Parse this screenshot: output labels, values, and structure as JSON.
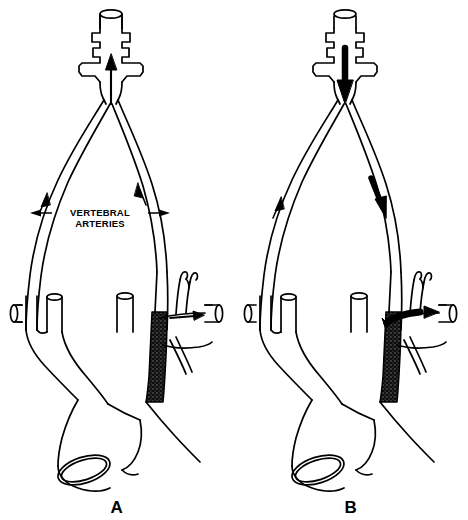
{
  "figure": {
    "type": "medical-illustration",
    "background_color": "#ffffff",
    "line_color": "#000000",
    "lesion_color": "#1a1a1a",
    "panel_count": 2
  },
  "labels": {
    "vertebral_arteries": "VERTEBRAL\nARTERIES",
    "panel_a_letter": "A",
    "panel_b_letter": "B"
  },
  "panel_a": {
    "letter": "A",
    "caption": "Stenosis of left subclavian artery proximal to vertebral origin; antegrade vertebral flow maintained",
    "lesion": {
      "name": "subclavian-stenosis",
      "fill": "stippled-black",
      "location": "proximal left subclavian artery"
    },
    "flow_arrows": [
      {
        "name": "basilar-arrow",
        "direction": "up",
        "weight": "thin",
        "meaning": "antegrade basilar flow"
      },
      {
        "name": "left-vertebral-arrow",
        "direction": "up",
        "weight": "thin",
        "meaning": "antegrade flow"
      },
      {
        "name": "right-vertebral-arrow",
        "direction": "up",
        "weight": "thin",
        "meaning": "antegrade flow"
      },
      {
        "name": "subclavian-branch-arrow",
        "direction": "right",
        "weight": "thin",
        "meaning": "reduced arm flow"
      }
    ]
  },
  "panel_b": {
    "letter": "B",
    "caption": "Subclavian steal: reversed flow down the vertebral artery supplying the arm",
    "lesion": {
      "name": "subclavian-stenosis",
      "fill": "stippled-black",
      "location": "proximal left subclavian artery"
    },
    "flow_arrows": [
      {
        "name": "basilar-arrow",
        "direction": "down",
        "weight": "thick",
        "meaning": "reversed basilar flow (steal)"
      },
      {
        "name": "left-vertebral-arrow",
        "direction": "up",
        "weight": "thin",
        "meaning": "antegrade flow"
      },
      {
        "name": "right-vertebral-arrow",
        "direction": "down",
        "weight": "thick",
        "meaning": "retrograde vertebral flow"
      },
      {
        "name": "subclavian-branch-arrow",
        "direction": "right",
        "weight": "thick",
        "meaning": "arm supplied by stolen flow"
      }
    ]
  },
  "anatomy": {
    "structures": [
      "basilar artery",
      "pontine branches",
      "vertebral arteries",
      "aortic arch",
      "ascending aorta",
      "innominate (brachiocephalic) artery",
      "right common carotid artery",
      "right subclavian artery",
      "left common carotid artery",
      "left subclavian artery",
      "left vertebral artery origin",
      "thyrocervical trunk"
    ]
  }
}
